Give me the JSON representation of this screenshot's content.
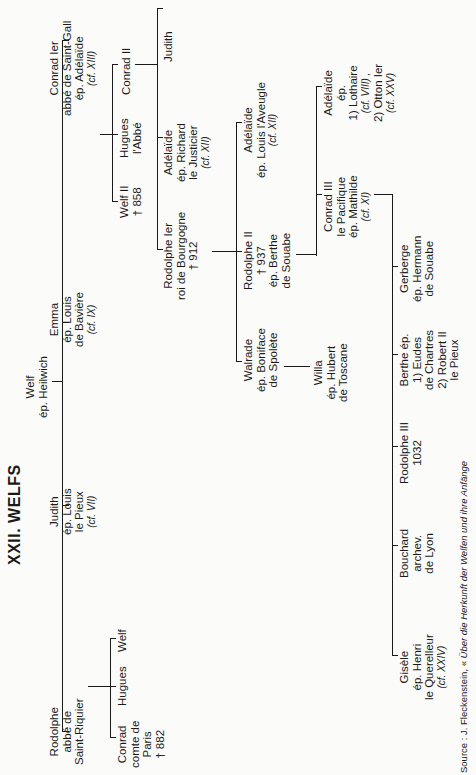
{
  "title": "XXII. WELFS",
  "root": {
    "lines": [
      "Welf",
      "ép. Heilwich"
    ]
  },
  "gen1": [
    {
      "id": "conrad1",
      "lines": [
        "Conrad Ier",
        "abbé de Saint-Gall",
        "ép. Adélaïde"
      ],
      "cf": "(cf. XIII)"
    },
    {
      "id": "emma",
      "lines": [
        "Emma",
        "ép. Louis",
        "de Bavière"
      ],
      "cf": "(cf. IX)"
    },
    {
      "id": "judith1",
      "lines": [
        "Judith",
        "ép. Louis",
        "le Pieux"
      ],
      "cf": "(cf. VII)"
    },
    {
      "id": "rodolphe_sr",
      "lines": [
        "Rodolphe",
        "abbé de",
        "Saint-Riquier"
      ]
    }
  ],
  "gen2_conrad": [
    {
      "id": "welf2",
      "lines": [
        "Welf II",
        "† 858"
      ]
    },
    {
      "id": "hugues_abbe",
      "lines": [
        "Hugues",
        "l'Abbé"
      ]
    },
    {
      "id": "conrad2",
      "lines": [
        "Conrad II"
      ]
    }
  ],
  "gen2_rodolphe": [
    {
      "id": "conrad_paris",
      "lines": [
        "Conrad",
        "comte de",
        "Paris",
        "† 882"
      ]
    },
    {
      "id": "hugues",
      "lines": [
        "Hugues"
      ]
    },
    {
      "id": "welf",
      "lines": [
        "Welf"
      ]
    }
  ],
  "gen3_conrad2": [
    {
      "id": "rodolphe1",
      "lines": [
        "Rodolphe Ier",
        "roi de Bourgogne",
        "† 912"
      ]
    },
    {
      "id": "adelaide_richard",
      "lines": [
        "Adélaïde",
        "ép. Richard",
        "le Justicier"
      ],
      "cf": "(cf. XII)"
    },
    {
      "id": "judith2",
      "lines": [
        "Judith"
      ]
    }
  ],
  "gen4_rodolphe1": [
    {
      "id": "walrade",
      "lines": [
        "Walrade",
        "ép. Boniface",
        "de Spolète"
      ]
    },
    {
      "id": "rodolphe2",
      "lines": [
        "Rodolphe II",
        "† 937",
        "ép. Berthe",
        "de Souabe"
      ]
    },
    {
      "id": "adelaide_louis",
      "lines": [
        "Adélaïde",
        "ép. Louis l'Aveugle"
      ],
      "cf": "(cf. XII)"
    }
  ],
  "gen5_walrade": [
    {
      "id": "willa",
      "lines": [
        "Willa",
        "ép. Hubert",
        "de Toscane"
      ]
    }
  ],
  "gen5_rodolphe2": [
    {
      "id": "conrad3",
      "lines": [
        "Conrad III",
        "le Pacifique",
        "ép. Mathilde"
      ],
      "cf": "(cf. XI)"
    },
    {
      "id": "adelaide_otton",
      "lines": [
        "Adélaïde",
        "ép.",
        "1) Lothaire"
      ],
      "cf": "(cf. VIII) ,",
      "lines2": [
        "2) Otton Ier"
      ],
      "cf2": "(cf. XXV)"
    }
  ],
  "gen6_conrad3": [
    {
      "id": "gisele",
      "lines": [
        "Gisèle",
        "ép. Henri",
        "le Querelleur"
      ],
      "cf": "(cf. XXIV)"
    },
    {
      "id": "bouchard",
      "lines": [
        "Bouchard",
        "archev.",
        "de Lyon"
      ]
    },
    {
      "id": "rodolphe3",
      "lines": [
        "Rodolphe III",
        "1032"
      ]
    },
    {
      "id": "berthe",
      "lines": [
        "Berthe ép.",
        "1) Eudes",
        "de Chartres",
        "2) Robert II",
        "le Pieux"
      ]
    },
    {
      "id": "gerberge",
      "lines": [
        "Gerberge",
        "ép. Hermann",
        "de Souabe"
      ]
    }
  ],
  "source": {
    "prefix": "Source : J. Fleckenstein, « ",
    "title": "Über die Herkunft der Welfen und ihre Anfänge"
  }
}
